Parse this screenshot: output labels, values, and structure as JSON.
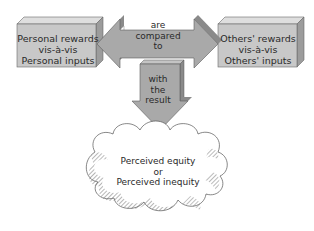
{
  "diagram": {
    "type": "process-flow",
    "left_box": {
      "line1": "Personal rewards",
      "line2": "vis-à-vis",
      "line3": "Personal inputs"
    },
    "right_box": {
      "line1": "Others' rewards",
      "line2": "vis-à-vis",
      "line3": "Others' inputs"
    },
    "double_arrow": {
      "line1": "are",
      "line2": "compared",
      "line3": "to"
    },
    "down_arrow": {
      "line1": "with",
      "line2": "the",
      "line3": "result"
    },
    "cloud": {
      "line1": "Perceived equity",
      "line2": "or",
      "line3": "Perceived inequity"
    },
    "colors": {
      "box_face": "#c8c8c8",
      "box_top": "#dedede",
      "box_side": "#9c9c9c",
      "arrow_fill": "#a9a9a9",
      "arrow_shade": "#8a8a8a",
      "outline": "#5a5a5a",
      "cloud_fill": "#ffffff",
      "cloud_hatch": "#707070"
    }
  }
}
